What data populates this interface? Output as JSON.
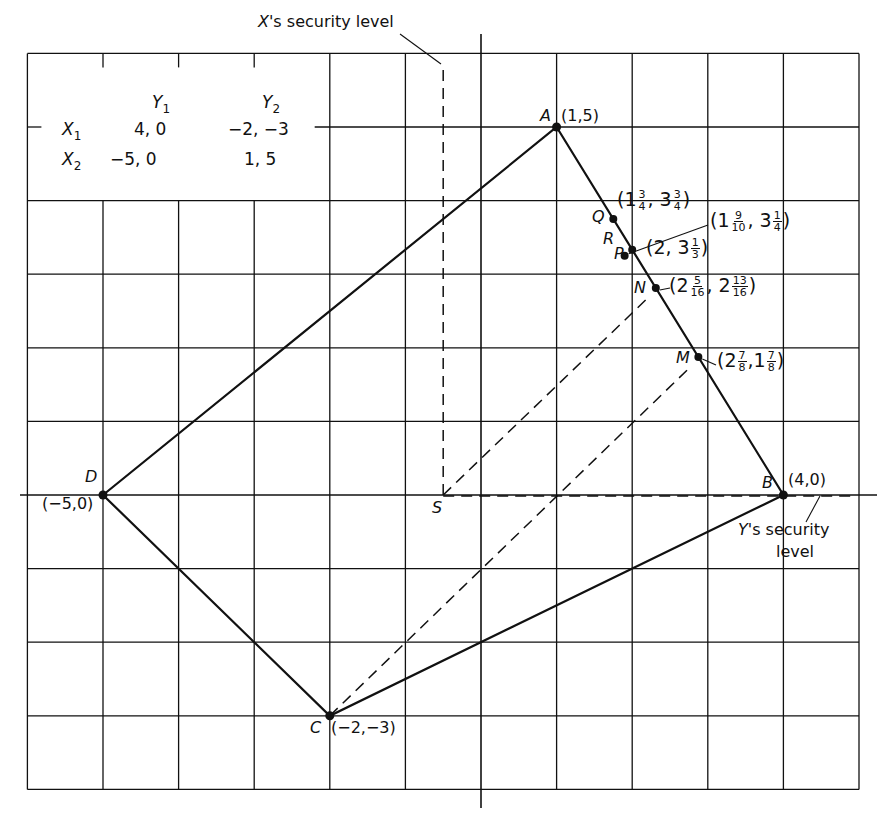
{
  "figure": {
    "grid": {
      "x_min": -6,
      "x_max": 5,
      "y_min": -4,
      "y_max": 6,
      "origin_px": [
        481,
        495
      ],
      "unit_px": [
        75.6,
        73.6
      ]
    },
    "axes": {
      "x_extent_px": [
        20,
        877
      ],
      "y_extent_px": [
        34,
        808
      ]
    },
    "colors": {
      "ink": "#111111",
      "paper": "#ffffff"
    }
  },
  "payoff_table": {
    "col_headers": [
      "Y",
      "Y"
    ],
    "col_subs": [
      "1",
      "2"
    ],
    "rows": [
      {
        "label": "X",
        "sub": "1",
        "cells": [
          "4,  0",
          "−2, −3"
        ]
      },
      {
        "label": "X",
        "sub": "2",
        "cells": [
          "−5,  0",
          "1,  5"
        ]
      }
    ]
  },
  "polygon": {
    "vertices": [
      {
        "name": "A",
        "x": 1,
        "y": 5,
        "coord_label": "(1,5)"
      },
      {
        "name": "B",
        "x": 4,
        "y": 0,
        "coord_label": "(4,0)"
      },
      {
        "name": "C",
        "x": -2,
        "y": -3,
        "coord_label": "(−2,−3)"
      },
      {
        "name": "D",
        "x": -5,
        "y": 0,
        "coord_label": "(−5,0)"
      }
    ]
  },
  "points_on_AB": [
    {
      "name": "Q",
      "x": 1.75,
      "y": 3.75,
      "label_whole": [
        "1",
        "3"
      ],
      "label_frac": [
        [
          "3",
          "4"
        ],
        [
          "3",
          "4"
        ]
      ]
    },
    {
      "name": "R",
      "x": 1.9,
      "y": 3.25,
      "label_whole": [
        "1",
        "3"
      ],
      "label_frac": [
        [
          "9",
          "10"
        ],
        [
          "1",
          "4"
        ]
      ]
    },
    {
      "name": "P",
      "x": 2,
      "y": 3.333,
      "label_whole": [
        "2",
        "3"
      ],
      "label_frac": [
        null,
        [
          "1",
          "3"
        ]
      ]
    },
    {
      "name": "N",
      "x": 2.3125,
      "y": 2.8125,
      "label_whole": [
        "2",
        "2"
      ],
      "label_frac": [
        [
          "5",
          "16"
        ],
        [
          "13",
          "16"
        ]
      ]
    },
    {
      "name": "M",
      "x": 2.875,
      "y": 1.875,
      "label_whole": [
        "2",
        "1"
      ],
      "label_frac": [
        [
          "7",
          "8"
        ],
        [
          "7",
          "8"
        ]
      ]
    }
  ],
  "special_points": [
    {
      "name": "S",
      "x": -0.5,
      "y": 0
    }
  ],
  "annotations": {
    "x_security": {
      "prefix": "X",
      "text": "'s security level"
    },
    "y_security": {
      "prefix": "Y",
      "text": "'s security",
      "line2": "level"
    }
  }
}
